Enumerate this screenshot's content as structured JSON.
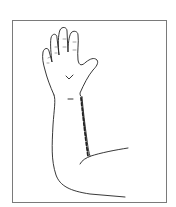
{
  "figure": {
    "annotation": "dashed-incision-line",
    "colors": {
      "frame": "#7a7a7a",
      "line": "#222222",
      "background": "#ffffff"
    }
  }
}
